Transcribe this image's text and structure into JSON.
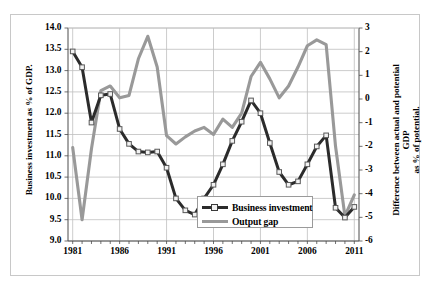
{
  "figure": {
    "frame_color": "#c8c8c8",
    "background": "#ffffff"
  },
  "chart_data": {
    "type": "line",
    "title": "",
    "subtitle": "",
    "xlabel": "",
    "ylabel": "Business investment as % of GDP.",
    "ylabel_right_line1": "Difference between actual and potential GDP",
    "ylabel_right_line2": "as % of potential.",
    "grid": true,
    "grid_color": "#bfbfbf",
    "legend_position": "bottom-center-inside",
    "x": [
      1981,
      1982,
      1983,
      1984,
      1985,
      1986,
      1987,
      1988,
      1989,
      1990,
      1991,
      1992,
      1993,
      1994,
      1995,
      1996,
      1997,
      1998,
      1999,
      2000,
      2001,
      2002,
      2003,
      2004,
      2005,
      2006,
      2007,
      2008,
      2009,
      2010,
      2011
    ],
    "xtick_labels": [
      "1981",
      "1986",
      "1991",
      "1996",
      "2001",
      "2006",
      "2011"
    ],
    "xticks": [
      1981,
      1986,
      1991,
      1996,
      2001,
      2006,
      2011
    ],
    "xlim": [
      1980.5,
      2011.5
    ],
    "axes": [
      {
        "id": "left",
        "label": "Business investment as % of GDP.",
        "ylim": [
          9.0,
          14.0
        ],
        "ytick_labels": [
          "9.0",
          "9.5",
          "10.0",
          "10.5",
          "11.0",
          "11.5",
          "12.0",
          "12.5",
          "13.0",
          "13.5",
          "14.0"
        ],
        "yticks": [
          9.0,
          9.5,
          10.0,
          10.5,
          11.0,
          11.5,
          12.0,
          12.5,
          13.0,
          13.5,
          14.0
        ]
      },
      {
        "id": "right",
        "label": "Difference between actual and potential GDP as % of potential.",
        "ylim": [
          -6,
          3
        ],
        "ytick_labels": [
          "-6",
          "-5",
          "-4",
          "-3",
          "-2",
          "-1",
          "0",
          "1",
          "2",
          "3"
        ],
        "yticks": [
          -6,
          -5,
          -4,
          -3,
          -2,
          -1,
          0,
          1,
          2,
          3
        ]
      }
    ],
    "series": [
      {
        "name": "Business investment",
        "axis": "left",
        "color": "#2b2b2b",
        "marker": "square",
        "marker_face": "#f2f2f2",
        "units": "% of GDP",
        "values": [
          13.45,
          13.08,
          11.78,
          12.42,
          12.45,
          11.63,
          11.28,
          11.1,
          11.08,
          11.1,
          10.72,
          10.0,
          9.72,
          9.62,
          10.0,
          10.32,
          10.8,
          11.35,
          11.8,
          12.3,
          12.0,
          11.3,
          10.62,
          10.32,
          10.4,
          10.8,
          11.22,
          11.48,
          9.78,
          9.55,
          9.8
        ]
      },
      {
        "name": "Output gap",
        "axis": "right",
        "color": "#999999",
        "marker": "none",
        "units": "% of potential",
        "values": [
          -2.05,
          -5.1,
          -2.1,
          0.35,
          0.55,
          0.05,
          0.15,
          1.7,
          2.65,
          1.35,
          -1.55,
          -1.9,
          -1.6,
          -1.35,
          -1.2,
          -1.5,
          -0.85,
          -1.2,
          -0.6,
          0.95,
          1.55,
          0.85,
          0.05,
          0.55,
          1.35,
          2.25,
          2.5,
          2.3,
          -2.0,
          -4.95,
          -4.05
        ]
      }
    ]
  },
  "legend": {
    "entries": [
      {
        "label": "Business investment",
        "color": "#2b2b2b",
        "marker": "square"
      },
      {
        "label": "Output gap",
        "color": "#999999",
        "marker": "none"
      }
    ]
  }
}
